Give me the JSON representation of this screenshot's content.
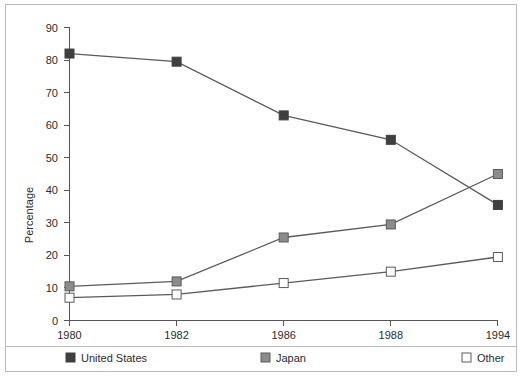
{
  "chart_data": {
    "type": "line",
    "title": "",
    "xlabel": "",
    "ylabel": "Percentage",
    "categories": [
      "1980",
      "1982",
      "1986",
      "1988",
      "1994"
    ],
    "ylim": [
      0,
      90
    ],
    "yticks": [
      0,
      10,
      20,
      30,
      40,
      50,
      60,
      70,
      80,
      90
    ],
    "ytick_labels": [
      "0",
      "10",
      "20",
      "30",
      "40",
      "50",
      "60",
      "70",
      "80",
      "90"
    ],
    "grid": false,
    "legend_position": "bottom",
    "series": [
      {
        "name": "United States",
        "marker": "filled-square",
        "color": "#3f3f3f",
        "values": [
          82,
          79.5,
          63,
          55.5,
          35.5
        ]
      },
      {
        "name": "Japan",
        "marker": "gray-square",
        "color": "#8c8c8c",
        "values": [
          10.5,
          12,
          25.5,
          29.5,
          45
        ]
      },
      {
        "name": "Other",
        "marker": "open-square",
        "color": "#ffffff",
        "values": [
          7,
          8,
          11.5,
          15,
          19.5
        ]
      }
    ]
  },
  "axis": {
    "y_label": "Percentage",
    "y_ticks": [
      "90",
      "80",
      "70",
      "60",
      "50",
      "40",
      "30",
      "20",
      "10",
      "0"
    ],
    "x_ticks": [
      "1980",
      "1982",
      "1986",
      "1988",
      "1994"
    ]
  },
  "legend": {
    "items": [
      {
        "label": "United States",
        "marker": "filled-square-marker"
      },
      {
        "label": "Japan",
        "marker": "gray-square-marker"
      },
      {
        "label": "Other",
        "marker": "open-square-marker"
      }
    ]
  },
  "colors": {
    "united_states": "#3f3f3f",
    "japan": "#8c8c8c",
    "other": "#ffffff",
    "line": "#5a5a5a",
    "axis": "#555555",
    "text": "#2b2b2b",
    "frame": "#b9b9b9"
  }
}
